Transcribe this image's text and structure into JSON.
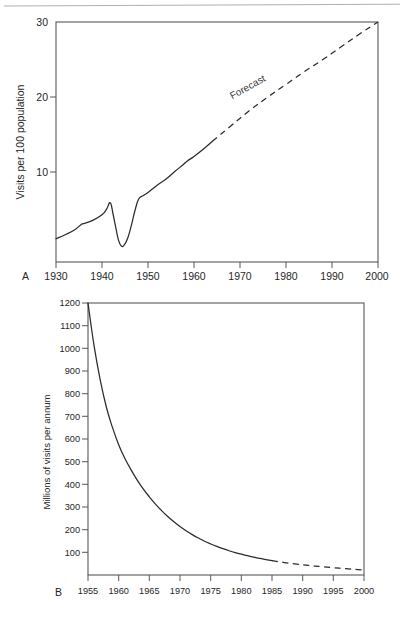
{
  "figure": {
    "background_color": "#ffffff",
    "line_color": "#2b2b2b",
    "frame_color": "#55585c",
    "panels": [
      "A",
      "B"
    ]
  },
  "chart_data": [
    {
      "type": "line",
      "panel_label": "A",
      "title": "",
      "xlabel": "",
      "ylabel": "Visits per 100 population",
      "xlim": [
        1930,
        2000
      ],
      "ylim": [
        0,
        30
      ],
      "xticks": [
        1930,
        1940,
        1950,
        1960,
        1970,
        1980,
        1990,
        2000
      ],
      "xticklabels": [
        "1930",
        "1940",
        "1950",
        "1960",
        "1970",
        "1980",
        "1990",
        "2000"
      ],
      "yticks": [
        10,
        20,
        30
      ],
      "yticklabels": [
        "10",
        "20",
        "30"
      ],
      "grid": false,
      "legend": "none",
      "annotations": [
        {
          "text": "Forecast",
          "x": 1972,
          "y": 21.5,
          "rotation": -29
        }
      ],
      "series": [
        {
          "name": "Observed",
          "style": "solid",
          "x": [
            1930,
            1932,
            1934,
            1935.5,
            1936,
            1938,
            1940,
            1941,
            1941.8,
            1942.4,
            1943,
            1943.6,
            1944.2,
            1944.8,
            1945.6,
            1946.4,
            1947.2,
            1948,
            1949,
            1950,
            1952,
            1954,
            1956,
            1957.5,
            1958.5,
            1960,
            1962,
            1964
          ],
          "y": [
            2.9,
            3.4,
            4.0,
            4.7,
            4.8,
            5.2,
            5.9,
            6.6,
            7.4,
            6.0,
            4.3,
            2.7,
            2.0,
            2.1,
            3.0,
            4.6,
            6.5,
            7.9,
            8.3,
            8.7,
            9.6,
            10.4,
            11.4,
            12.1,
            12.6,
            13.2,
            14.1,
            15.1
          ]
        },
        {
          "name": "Forecast",
          "style": "dashed",
          "x": [
            1964,
            1968,
            1972,
            1976,
            1980,
            1984,
            1988,
            1992,
            1996,
            2000
          ],
          "y": [
            15.1,
            17.0,
            18.9,
            20.6,
            22.2,
            23.8,
            25.3,
            26.9,
            28.5,
            30.0
          ]
        }
      ]
    },
    {
      "type": "line",
      "panel_label": "B",
      "title": "",
      "xlabel": "",
      "ylabel": "Millions of visits per annum",
      "xlim": [
        1955,
        2000
      ],
      "ylim": [
        0,
        1200
      ],
      "xticks": [
        1955,
        1960,
        1965,
        1970,
        1975,
        1980,
        1985,
        1990,
        1995,
        2000
      ],
      "xticklabels": [
        "1955",
        "1960",
        "1965",
        "1970",
        "1975",
        "1980",
        "1985",
        "1990",
        "1995",
        "2000"
      ],
      "yticks": [
        100,
        200,
        300,
        400,
        500,
        600,
        700,
        800,
        900,
        1000,
        1100,
        1200
      ],
      "yticklabels": [
        "100",
        "200",
        "300",
        "400",
        "500",
        "600",
        "700",
        "800",
        "900",
        "1000",
        "1100",
        "1200"
      ],
      "grid": false,
      "legend": "none",
      "annotations": [],
      "series": [
        {
          "name": "Observed",
          "style": "solid",
          "x": [
            1955,
            1956,
            1957,
            1958,
            1959,
            1960,
            1961,
            1962,
            1963,
            1964,
            1965,
            1966,
            1967,
            1968,
            1969,
            1970,
            1971,
            1972,
            1973,
            1974,
            1975,
            1976,
            1977,
            1978,
            1979,
            1980,
            1981,
            1982,
            1983,
            1984,
            1985
          ],
          "y": [
            1200,
            1010,
            860,
            740,
            650,
            575,
            515,
            465,
            420,
            380,
            345,
            313,
            284,
            258,
            235,
            214,
            195,
            178,
            163,
            149,
            137,
            126,
            116,
            107,
            99,
            92,
            85,
            79,
            73,
            68,
            63
          ]
        },
        {
          "name": "Forecast",
          "style": "dashed",
          "x": [
            1985,
            1987,
            1989,
            1991,
            1993,
            1995,
            1997,
            1999,
            2000
          ],
          "y": [
            63,
            55,
            48,
            42,
            37,
            32,
            28,
            24,
            22
          ]
        }
      ]
    }
  ]
}
